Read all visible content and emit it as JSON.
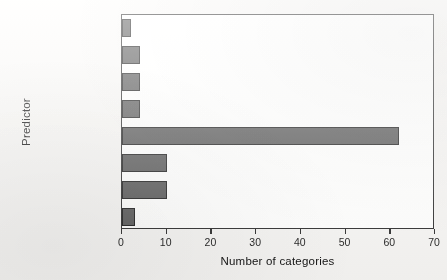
{
  "chart_data": {
    "type": "bar",
    "orientation": "horizontal",
    "title": "",
    "xlabel": "Number of categories",
    "ylabel": "Predictor",
    "categories": [
      "gender",
      "age",
      "weight",
      "medical specialty",
      "max glu serum",
      "metformin",
      "insulin",
      "diabetesMed"
    ],
    "values": [
      3,
      10,
      10,
      62,
      4,
      4,
      4,
      2
    ],
    "xlim": [
      0,
      70
    ],
    "xticks": [
      0,
      10,
      20,
      30,
      40,
      50,
      60,
      70
    ],
    "xtick_labels": [
      "0",
      "10",
      "20",
      "30",
      "40",
      "50",
      "60",
      "70"
    ],
    "grid": false,
    "legend": null,
    "bar_color": "#585858",
    "bar_edge_color": "#1d1d1d",
    "axes_color": "#2b2b2b",
    "background_color": "#f2f1ef",
    "plot_background_color": "#fbfbfa"
  }
}
